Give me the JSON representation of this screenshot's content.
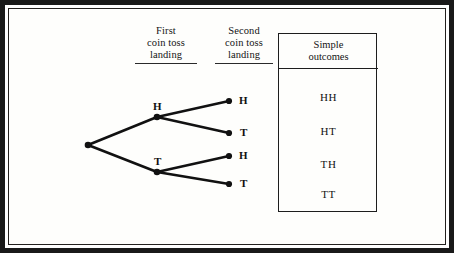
{
  "figure": {
    "type": "probability-tree-diagram",
    "background_color": "#fdfdfb",
    "ink_color": "#141414"
  },
  "columns": {
    "first": {
      "line1": "First",
      "line2": "coin toss",
      "line3": "landing"
    },
    "second": {
      "line1": "Second",
      "line2": "coin toss",
      "line3": "landing"
    }
  },
  "outcomes_box": {
    "header_line1": "Simple",
    "header_line2": "outcomes",
    "items": [
      "HH",
      "HT",
      "TH",
      "TT"
    ]
  },
  "tree": {
    "root_label": "",
    "level1": [
      {
        "label": "H"
      },
      {
        "label": "T"
      }
    ],
    "level2": [
      {
        "label": "H"
      },
      {
        "label": "T"
      },
      {
        "label": "H"
      },
      {
        "label": "T"
      }
    ]
  },
  "chart_data": {
    "type": "diagram",
    "title": "",
    "nodes": [
      {
        "id": "root",
        "label": "",
        "x": 88,
        "y": 145,
        "level": 0
      },
      {
        "id": "h1",
        "label": "H",
        "x": 157,
        "y": 117,
        "level": 1
      },
      {
        "id": "t1",
        "label": "T",
        "x": 157,
        "y": 172,
        "level": 1
      },
      {
        "id": "hh",
        "label": "H",
        "x": 229,
        "y": 101,
        "level": 2
      },
      {
        "id": "ht",
        "label": "T",
        "x": 229,
        "y": 133,
        "level": 2
      },
      {
        "id": "th",
        "label": "H",
        "x": 229,
        "y": 156,
        "level": 2
      },
      {
        "id": "tt",
        "label": "T",
        "x": 229,
        "y": 184,
        "level": 2
      }
    ],
    "edges": [
      {
        "from": "root",
        "to": "h1"
      },
      {
        "from": "root",
        "to": "t1"
      },
      {
        "from": "h1",
        "to": "hh"
      },
      {
        "from": "h1",
        "to": "ht"
      },
      {
        "from": "t1",
        "to": "th"
      },
      {
        "from": "t1",
        "to": "tt"
      }
    ],
    "outcomes": [
      "HH",
      "HT",
      "TH",
      "TT"
    ]
  }
}
